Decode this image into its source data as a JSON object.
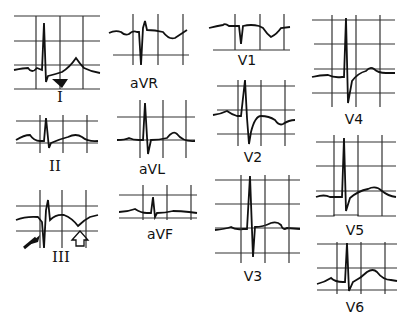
{
  "figure": {
    "type": "12-lead ECG",
    "colors": {
      "ink": "#111111",
      "grid": "#333333",
      "background": "#ffffff"
    },
    "leads": [
      {
        "id": "I",
        "label": "I",
        "annotation": "solid-arrowhead-pointing-to-ST"
      },
      {
        "id": "II",
        "label": "II"
      },
      {
        "id": "III",
        "label": "III",
        "annotation": "solid-arrow-at-Q-wave and open-arrow-at-inverted-T"
      },
      {
        "id": "aVR",
        "label": "aVR"
      },
      {
        "id": "aVL",
        "label": "aVL"
      },
      {
        "id": "aVF",
        "label": "aVF"
      },
      {
        "id": "V1",
        "label": "V1"
      },
      {
        "id": "V2",
        "label": "V2"
      },
      {
        "id": "V3",
        "label": "V3"
      },
      {
        "id": "V4",
        "label": "V4"
      },
      {
        "id": "V5",
        "label": "V5"
      },
      {
        "id": "V6",
        "label": "V6"
      }
    ]
  }
}
